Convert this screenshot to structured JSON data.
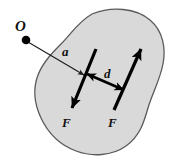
{
  "figure": {
    "canvas": {
      "width": 172,
      "height": 164,
      "background": "#ffffff"
    },
    "body": {
      "name": "rigid-body-blob",
      "fill": "#d9d9d9",
      "stroke": "#5a5a5a",
      "stroke_width": 1.3
    },
    "point_O": {
      "label": "O",
      "dot_color": "#000000",
      "x": 26,
      "y": 40
    },
    "vector_a": {
      "label": "a",
      "color": "#1a1a1a",
      "stroke_width": 1.1,
      "from_x": 28,
      "from_y": 42,
      "to_x": 84,
      "to_y": 75
    },
    "force_left": {
      "label": "F",
      "color": "#000000",
      "stroke_width": 3.2,
      "from_x": 96,
      "from_y": 49,
      "to_x": 72,
      "to_y": 108
    },
    "force_right": {
      "label": "F",
      "color": "#000000",
      "stroke_width": 3.2,
      "from_x": 114,
      "from_y": 110,
      "to_x": 141,
      "to_y": 49
    },
    "distance_d": {
      "label": "d",
      "color": "#000000",
      "stroke_width": 2.6,
      "from_x": 87,
      "from_y": 74,
      "to_x": 124,
      "to_y": 90
    }
  }
}
